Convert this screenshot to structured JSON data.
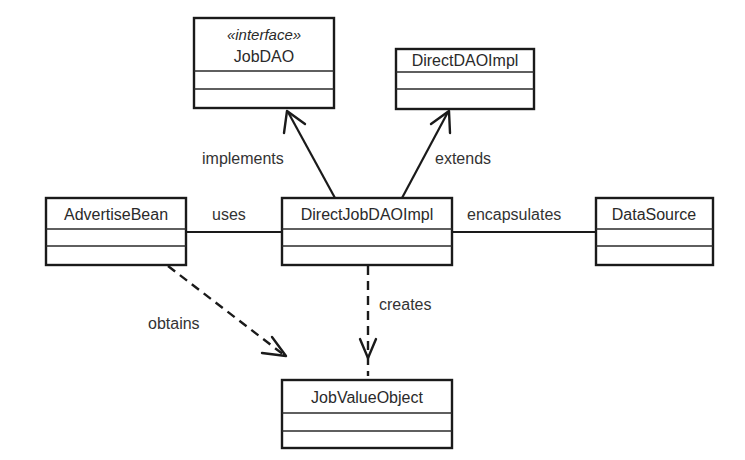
{
  "diagram": {
    "type": "uml-class-diagram",
    "classes": {
      "job_dao": {
        "stereotype": "«interface»",
        "name": "JobDAO"
      },
      "direct_dao_impl": {
        "name": "DirectDAOImpl"
      },
      "advertise_bean": {
        "name": "AdvertiseBean"
      },
      "direct_job_dao_impl": {
        "name": "DirectJobDAOImpl"
      },
      "data_source": {
        "name": "DataSource"
      },
      "job_value_object": {
        "name": "JobValueObject"
      }
    },
    "relationships": {
      "implements": {
        "label": "implements",
        "from": "DirectJobDAOImpl",
        "to": "JobDAO",
        "style": "solid-open-arrow"
      },
      "extends": {
        "label": "extends",
        "from": "DirectJobDAOImpl",
        "to": "DirectDAOImpl",
        "style": "solid-open-arrow"
      },
      "uses": {
        "label": "uses",
        "from": "AdvertiseBean",
        "to": "DirectJobDAOImpl",
        "style": "solid-line"
      },
      "encapsulates": {
        "label": "encapsulates",
        "from": "DirectJobDAOImpl",
        "to": "DataSource",
        "style": "solid-line"
      },
      "creates": {
        "label": "creates",
        "from": "DirectJobDAOImpl",
        "to": "JobValueObject",
        "style": "dashed-open-arrow"
      },
      "obtains": {
        "label": "obtains",
        "from": "AdvertiseBean",
        "to": "JobValueObject",
        "style": "dashed-open-arrow"
      }
    }
  }
}
